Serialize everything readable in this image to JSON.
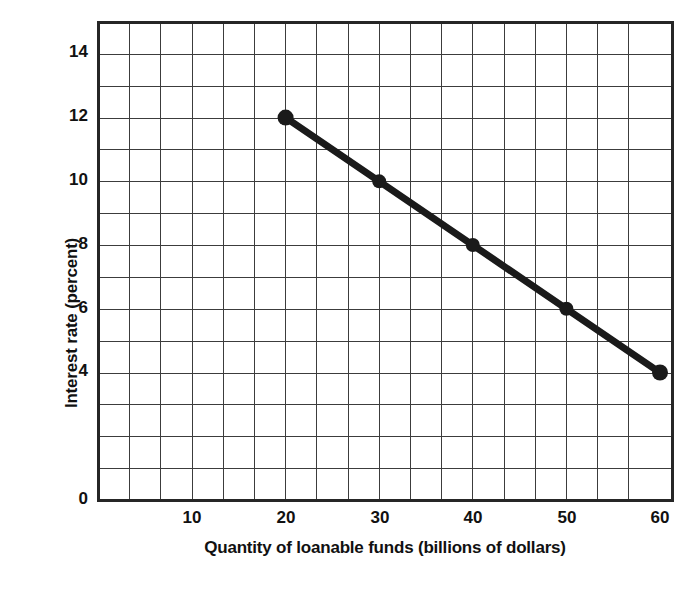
{
  "chart_data": {
    "type": "line",
    "title": "",
    "xlabel": "Quantity of loanable funds (billions of dollars)",
    "ylabel": "Interest rate (percent)",
    "x": [
      20,
      30,
      40,
      50,
      60
    ],
    "values": [
      12,
      10,
      8,
      6,
      4
    ],
    "series": [
      {
        "name": "Demand for loanable funds",
        "x": [
          20,
          30,
          40,
          50,
          60
        ],
        "values": [
          12,
          10,
          8,
          6,
          4
        ]
      }
    ],
    "xlim": [
      0,
      62
    ],
    "ylim": [
      0,
      15
    ],
    "xticks": [
      10,
      20,
      30,
      40,
      50,
      60
    ],
    "xtick_labels": [
      "10",
      "20",
      "30",
      "40",
      "50",
      "60"
    ],
    "yticks": [
      0,
      4,
      6,
      8,
      10,
      12,
      14
    ],
    "ytick_labels": [
      "0",
      "4",
      "6",
      "8",
      "10",
      "12",
      "14"
    ],
    "grid": true,
    "grid_x_step": 3.4,
    "grid_y_step": 1,
    "legend": "none",
    "line_color": "#1a1a1a",
    "marker": "circle",
    "marker_color": "#1a1a1a",
    "axis_color": "#262626",
    "grid_color": "#3c3c3c",
    "background": "#ffffff"
  },
  "axis": {
    "x_title": "Quantity of loanable funds (billions of dollars)",
    "y_title": "Interest rate (percent)",
    "x_tick_labels": [
      "10",
      "20",
      "30",
      "40",
      "50",
      "60"
    ],
    "y_tick_labels": [
      "14",
      "12",
      "10",
      "8",
      "6",
      "4",
      "0"
    ]
  }
}
